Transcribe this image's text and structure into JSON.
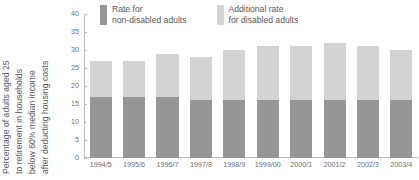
{
  "chart_data": {
    "type": "bar",
    "stacked": true,
    "title": "",
    "xlabel": "",
    "ylabel": "Percentage of adults aged 25 to retirement in households below 60% median income after deducting housing costs",
    "ylabel_lines": [
      "Percentage of adults aged 25",
      "to retirement in households",
      "below 60% median income",
      "after deducting housing costs"
    ],
    "categories": [
      "1994/5",
      "1995/6",
      "1996/7",
      "1997/8",
      "1998/9",
      "1999/00",
      "2000/1",
      "2001/2",
      "2002/3",
      "2003/4"
    ],
    "series": [
      {
        "name": "Rate for non-disabled adults",
        "color": "#969696",
        "values": [
          17,
          17,
          17,
          16,
          16,
          16,
          16,
          16,
          16,
          16
        ]
      },
      {
        "name": "Additional rate for disabled adults",
        "color": "#d3d3d3",
        "values": [
          10,
          10,
          12,
          12,
          14,
          15,
          15,
          16,
          15,
          14
        ]
      }
    ],
    "totals": [
      27,
      27,
      29,
      28,
      30,
      31,
      31,
      32,
      31,
      30
    ],
    "ylim": [
      0,
      40
    ],
    "yticks": [
      0,
      5,
      10,
      15,
      20,
      25,
      30,
      35,
      40
    ],
    "ytick_labels": [
      "0",
      "5",
      "10",
      "15",
      "20",
      "25",
      "30",
      "35",
      "40"
    ],
    "grid": false,
    "legend_position": "top"
  },
  "legend": {
    "items": [
      {
        "label_line1": "Rate for",
        "label_line2": "non-disabled adults",
        "color": "#969696"
      },
      {
        "label_line1": "Additional rate",
        "label_line2": "for disabled adults",
        "color": "#d3d3d3"
      }
    ]
  }
}
